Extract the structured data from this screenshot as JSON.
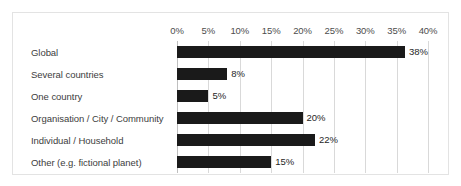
{
  "chart_data": {
    "type": "bar",
    "orientation": "horizontal",
    "title": "",
    "subtitle": "",
    "xlabel": "",
    "ylabel": "",
    "xlim": [
      0,
      40
    ],
    "grid": true,
    "legend": false,
    "legend_position": "none",
    "bar_color": "#1a1a1a",
    "gridline_color": "#d9d9d9",
    "border_color": "#e3e3e3",
    "axis_tick_labels": [
      "0%",
      "5%",
      "10%",
      "15%",
      "20%",
      "25%",
      "30%",
      "35%",
      "40%"
    ],
    "axis_tick_values": [
      0,
      5,
      10,
      15,
      20,
      25,
      30,
      35,
      40
    ],
    "categories": [
      "Global",
      "Several countries",
      "One country",
      "Organisation / City / Community",
      "Individual / Household",
      "Other (e.g. fictional planet)"
    ],
    "values": [
      38,
      8,
      5,
      20,
      22,
      15
    ],
    "data_labels": [
      "38%",
      "8%",
      "5%",
      "20%",
      "22%",
      "15%"
    ]
  }
}
